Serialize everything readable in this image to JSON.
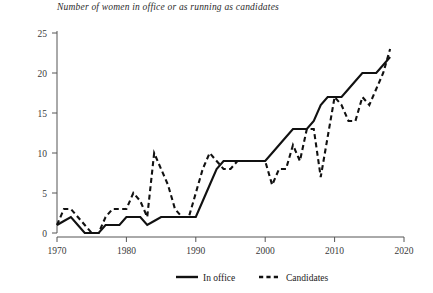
{
  "chart_data": {
    "type": "line",
    "title": "Number of women in office or as running as candidates",
    "xlabel": "",
    "ylabel": "",
    "xlim": [
      1970,
      2020
    ],
    "ylim": [
      0,
      25
    ],
    "grid": false,
    "legend_position": "bottom-center",
    "xticks": [
      "1970",
      "1980",
      "1990",
      "2000",
      "2010",
      "2020"
    ],
    "xtick_values": [
      1970,
      1980,
      1990,
      2000,
      2010,
      2020
    ],
    "yticks": [
      "0",
      "5",
      "10",
      "15",
      "20",
      "25"
    ],
    "ytick_values": [
      0,
      5,
      10,
      15,
      20,
      25
    ],
    "series": [
      {
        "name": "In office",
        "style": "solid",
        "color": "#111111",
        "x": [
          1970,
          1971,
          1972,
          1973,
          1974,
          1975,
          1976,
          1977,
          1978,
          1979,
          1980,
          1981,
          1982,
          1983,
          1984,
          1985,
          1986,
          1987,
          1988,
          1989,
          1990,
          1991,
          1992,
          1993,
          1994,
          1995,
          1996,
          1997,
          1998,
          1999,
          2000,
          2001,
          2002,
          2003,
          2004,
          2005,
          2006,
          2007,
          2008,
          2009,
          2010,
          2011,
          2012,
          2013,
          2014,
          2015,
          2016,
          2017,
          2018
        ],
        "values": [
          1,
          1.5,
          2,
          1,
          0,
          0,
          0,
          1,
          1,
          1,
          2,
          2,
          2,
          1,
          1.5,
          2,
          2,
          2,
          2,
          2,
          2,
          4,
          6,
          8,
          9,
          9,
          9,
          9,
          9,
          9,
          9,
          10,
          11,
          12,
          13,
          13,
          13,
          14,
          16,
          17,
          17,
          17,
          18,
          19,
          20,
          20,
          20,
          21,
          22
        ]
      },
      {
        "name": "Candidates",
        "style": "dashed",
        "color": "#111111",
        "x": [
          1970,
          1971,
          1972,
          1973,
          1974,
          1975,
          1976,
          1977,
          1978,
          1979,
          1980,
          1981,
          1982,
          1983,
          1984,
          1985,
          1986,
          1987,
          1988,
          1989,
          1990,
          1991,
          1992,
          1993,
          1994,
          1995,
          1996,
          1997,
          1998,
          1999,
          2000,
          2001,
          2002,
          2003,
          2004,
          2005,
          2006,
          2007,
          2008,
          2009,
          2010,
          2011,
          2012,
          2013,
          2014,
          2015,
          2016,
          2017,
          2018
        ],
        "values": [
          1,
          3,
          3,
          2,
          1,
          0,
          0,
          2,
          3,
          3,
          3,
          5,
          4,
          2,
          10,
          8,
          6,
          3,
          2,
          2,
          5,
          8,
          10,
          9,
          8,
          8,
          9,
          9,
          9,
          9,
          9,
          6,
          8,
          8,
          11,
          9,
          13,
          13,
          7,
          12,
          17,
          16,
          14,
          14,
          17,
          16,
          18,
          20,
          23
        ]
      }
    ],
    "legend": [
      {
        "label": "In office",
        "style": "solid"
      },
      {
        "label": "Candidates",
        "style": "dashed"
      }
    ]
  }
}
